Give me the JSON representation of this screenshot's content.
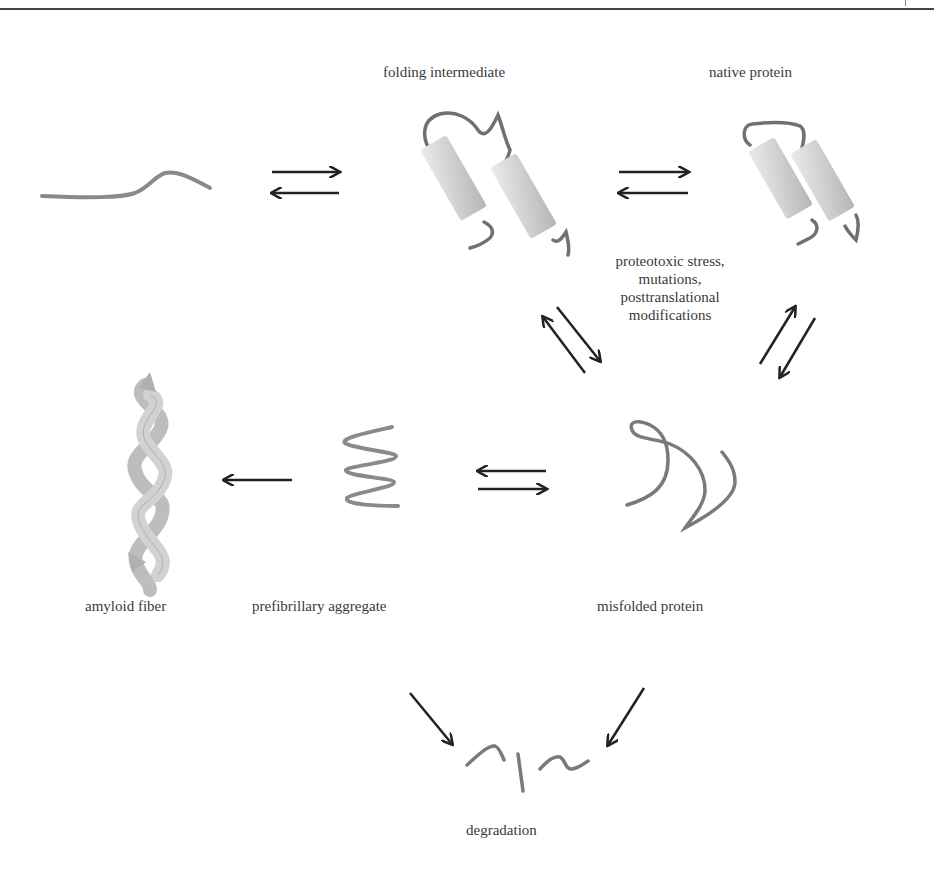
{
  "figure": {
    "labels": {
      "folding_intermediate": "folding intermediate",
      "native_protein": "native protein",
      "stress_line1": "proteotoxic stress,",
      "stress_line2": "mutations,",
      "stress_line3": "posttranslational",
      "stress_line4": "modifications",
      "amyloid_fiber": "amyloid fiber",
      "prefibrillary_aggregate": "prefibrillary aggregate",
      "misfolded_protein": "misfolded protein",
      "degradation": "degradation"
    },
    "colors": {
      "arrow": "#222222",
      "chain": "#7a7a7a",
      "helix_light": "#e4e4e4",
      "helix_dark": "#b8b8b8",
      "rule": "#444444"
    },
    "nodes": [
      {
        "id": "unfolded",
        "label": ""
      },
      {
        "id": "folding_intermediate",
        "label": "folding intermediate"
      },
      {
        "id": "native_protein",
        "label": "native protein"
      },
      {
        "id": "misfolded_protein",
        "label": "misfolded protein"
      },
      {
        "id": "prefibrillary_aggregate",
        "label": "prefibrillary aggregate"
      },
      {
        "id": "amyloid_fiber",
        "label": "amyloid fiber"
      },
      {
        "id": "degradation",
        "label": "degradation"
      }
    ],
    "edges": [
      {
        "from": "unfolded",
        "to": "folding_intermediate",
        "type": "reversible"
      },
      {
        "from": "folding_intermediate",
        "to": "native_protein",
        "type": "reversible"
      },
      {
        "from": "folding_intermediate",
        "to": "misfolded_protein",
        "type": "reversible"
      },
      {
        "from": "native_protein",
        "to": "misfolded_protein",
        "type": "reversible"
      },
      {
        "from": "misfolded_protein",
        "to": "prefibrillary_aggregate",
        "type": "reversible"
      },
      {
        "from": "prefibrillary_aggregate",
        "to": "amyloid_fiber",
        "type": "irreversible"
      },
      {
        "from": "prefibrillary_aggregate",
        "to": "degradation",
        "type": "irreversible"
      },
      {
        "from": "misfolded_protein",
        "to": "degradation",
        "type": "irreversible"
      }
    ]
  }
}
